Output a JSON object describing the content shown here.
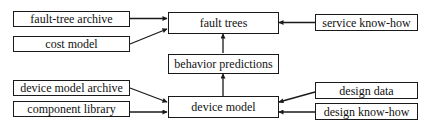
{
  "diagram": {
    "nodes": {
      "fault_tree_archive": "fault-tree archive",
      "cost_model": "cost model",
      "fault_trees": "fault trees",
      "service_know_how": "service know-how",
      "behavior_predictions": "behavior predictions",
      "device_model_archive": "device model archive",
      "component_library": "component library",
      "device_model": "device model",
      "design_data": "design data",
      "design_know_how": "design know-how"
    },
    "edges": [
      {
        "from": "fault-tree archive",
        "to": "fault trees"
      },
      {
        "from": "cost model",
        "to": "fault trees"
      },
      {
        "from": "service know-how",
        "to": "fault trees"
      },
      {
        "from": "behavior predictions",
        "to": "fault trees"
      },
      {
        "from": "device model",
        "to": "behavior predictions"
      },
      {
        "from": "device model archive",
        "to": "device model"
      },
      {
        "from": "component library",
        "to": "device model"
      },
      {
        "from": "design data",
        "to": "device model"
      },
      {
        "from": "design know-how",
        "to": "device model"
      }
    ],
    "colors": {
      "stroke": "#1a1a1a",
      "background": "#ffffff",
      "text": "#111111"
    }
  }
}
